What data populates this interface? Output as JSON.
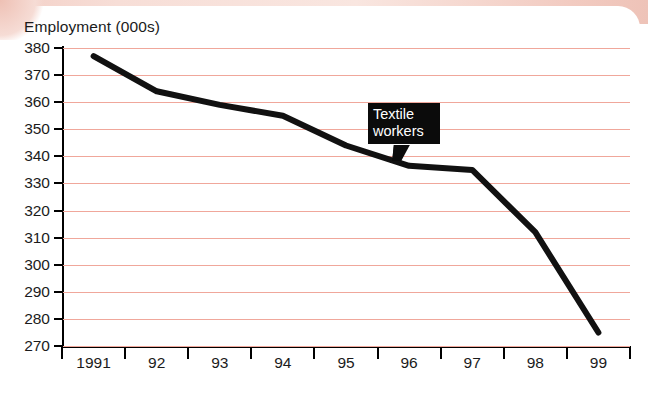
{
  "chart_data": {
    "type": "line",
    "title": "Employment (000s)",
    "xlabel": "",
    "ylabel": "Employment (000s)",
    "categories": [
      "1991",
      "92",
      "93",
      "94",
      "95",
      "96",
      "97",
      "98",
      "99"
    ],
    "series": [
      {
        "name": "Textile workers",
        "values": [
          377,
          364,
          359,
          355,
          344,
          336.5,
          335,
          312,
          275
        ]
      }
    ],
    "ylim": [
      270,
      380
    ],
    "ytick_step": 10,
    "yticks": [
      380,
      370,
      360,
      350,
      340,
      330,
      320,
      310,
      300,
      290,
      280,
      270
    ],
    "ytick_labels": [
      "380",
      "370",
      "360",
      "350",
      "340",
      "330",
      "320",
      "310",
      "300",
      "290",
      "280",
      "270"
    ],
    "grid": true,
    "grid_color": "#f0a79b",
    "legend": "none",
    "annotations": [
      {
        "text": "Textile workers",
        "lines": [
          "Textile",
          "workers"
        ],
        "style": "callout-box",
        "background": "#0b0b0b",
        "text_color": "#ffffff",
        "points_to_category": "96"
      }
    ],
    "line_color": "#111111",
    "line_width": 6
  },
  "decor": {
    "band_color": "#f3cfc6"
  }
}
